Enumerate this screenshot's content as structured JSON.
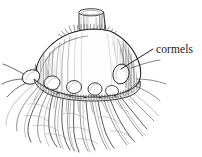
{
  "figure": {
    "medium": "pen-and-ink line drawing",
    "background_color": "#ffffff",
    "ink_color": "#262626",
    "width": 202,
    "height": 157
  },
  "labels": {
    "cormels": {
      "text": "cormels",
      "x": 156,
      "y": 43
    }
  },
  "leader_line": {
    "name": "cormels-leader-line",
    "from_x": 153,
    "from_y": 49,
    "to_x": 121,
    "to_y": 69,
    "color": "#1f1f1f"
  },
  "parts": [
    {
      "name": "cut-stem",
      "label": "cut stem"
    },
    {
      "name": "corm-body",
      "label": "corm body"
    },
    {
      "name": "cormel-cluster",
      "label": "cormels"
    },
    {
      "name": "basal-plate",
      "label": "basal plate"
    },
    {
      "name": "fibrous-roots",
      "label": "fibrous roots"
    }
  ]
}
